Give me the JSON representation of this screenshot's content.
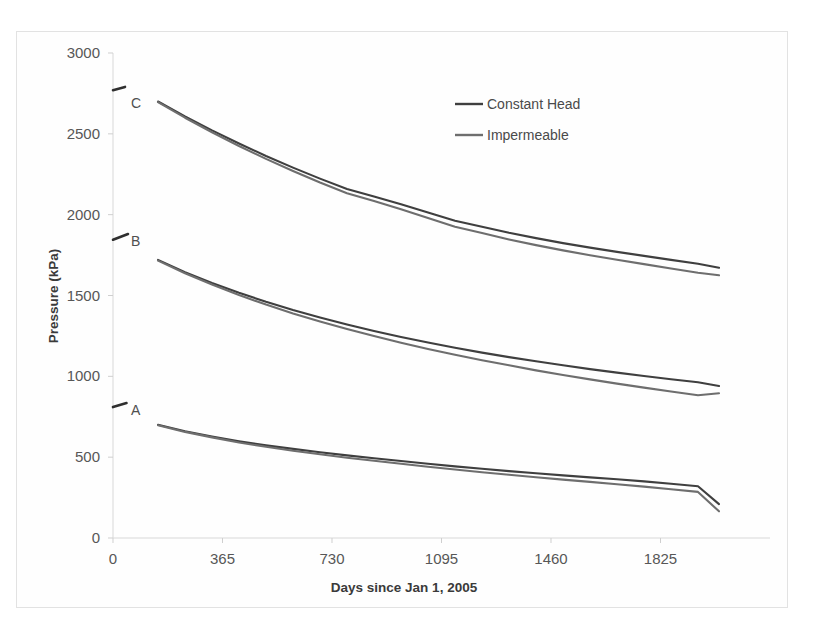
{
  "figure": {
    "background_color": "#ffffff",
    "frame_color": "#e2e2e2"
  },
  "chart_data": {
    "type": "line",
    "title": "",
    "subtitle": "",
    "xlabel": "Days since Jan 1, 2005",
    "ylabel": "Pressure (kPa)",
    "xlim": [
      0,
      2190
    ],
    "ylim": [
      0,
      3000
    ],
    "xticks": [
      0,
      365,
      730,
      1095,
      1460,
      1825
    ],
    "xtick_labels": [
      "0",
      "365",
      "730",
      "1095",
      "1460",
      "1825"
    ],
    "yticks": [
      0,
      500,
      1000,
      1500,
      2000,
      2500,
      3000
    ],
    "ytick_labels": [
      "0",
      "500",
      "1000",
      "1500",
      "2000",
      "2500",
      "3000"
    ],
    "grid": false,
    "legend_position": "upper center",
    "legend": [
      {
        "name": "Constant Head",
        "color": "#3f3f3f"
      },
      {
        "name": "Impermeable",
        "color": "#6e6e6e"
      }
    ],
    "curve_group_labels": [
      {
        "label": "A",
        "x": 40,
        "y": 800
      },
      {
        "label": "B",
        "x": 40,
        "y": 1845
      },
      {
        "label": "C",
        "x": 40,
        "y": 2700
      }
    ],
    "axis_stubs": [
      {
        "group": "A",
        "x0": 0,
        "y0": 810,
        "x1": 45,
        "y1": 835
      },
      {
        "group": "B",
        "x0": 0,
        "y0": 1845,
        "x1": 50,
        "y1": 1880
      },
      {
        "group": "C",
        "x0": 0,
        "y0": 2770,
        "x1": 40,
        "y1": 2790
      }
    ],
    "x": [
      150,
      240,
      330,
      420,
      510,
      600,
      690,
      780,
      870,
      960,
      1050,
      1140,
      1230,
      1320,
      1410,
      1500,
      1590,
      1680,
      1770,
      1860,
      1950,
      2020
    ],
    "series": [
      {
        "name": "A - Constant Head",
        "group": "A",
        "style": "Constant Head",
        "color": "#3f3f3f",
        "values": [
          700,
          660,
          627,
          598,
          573,
          551,
          530,
          511,
          493,
          476,
          459,
          443,
          428,
          414,
          400,
          387,
          375,
          363,
          350,
          335,
          320,
          210
        ]
      },
      {
        "name": "A - Impermeable",
        "group": "A",
        "style": "Impermeable",
        "color": "#6e6e6e",
        "values": [
          698,
          656,
          622,
          591,
          564,
          540,
          518,
          497,
          478,
          459,
          441,
          424,
          407,
          391,
          376,
          361,
          347,
          333,
          318,
          302,
          285,
          165
        ]
      },
      {
        "name": "B - Constant Head",
        "group": "B",
        "style": "Constant Head",
        "color": "#3f3f3f",
        "values": [
          1720,
          1645,
          1578,
          1517,
          1461,
          1410,
          1363,
          1320,
          1280,
          1243,
          1209,
          1177,
          1147,
          1119,
          1093,
          1068,
          1045,
          1023,
          1002,
          982,
          963,
          940
        ]
      },
      {
        "name": "B - Impermeable",
        "group": "B",
        "style": "Impermeable",
        "color": "#6e6e6e",
        "values": [
          1716,
          1638,
          1568,
          1503,
          1444,
          1389,
          1339,
          1292,
          1249,
          1208,
          1170,
          1134,
          1100,
          1068,
          1037,
          1008,
          981,
          955,
          930,
          906,
          883,
          895
        ]
      },
      {
        "name": "C - Constant Head",
        "group": "C",
        "style": "Constant Head",
        "color": "#3f3f3f",
        "values": [
          2700,
          2608,
          2521,
          2440,
          2363,
          2291,
          2223,
          2159,
          2113,
          2065,
          2014,
          1962,
          1925,
          1888,
          1855,
          1824,
          1796,
          1770,
          1745,
          1720,
          1696,
          1672
        ]
      },
      {
        "name": "C - Impermeable",
        "group": "C",
        "style": "Impermeable",
        "color": "#6e6e6e",
        "values": [
          2696,
          2600,
          2510,
          2425,
          2345,
          2270,
          2199,
          2132,
          2084,
          2033,
          1979,
          1925,
          1886,
          1847,
          1812,
          1779,
          1749,
          1721,
          1694,
          1667,
          1641,
          1625
        ]
      }
    ]
  }
}
